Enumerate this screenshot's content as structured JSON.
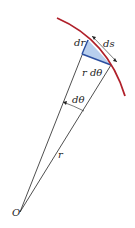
{
  "diagram": {
    "title": "",
    "labels": {
      "dr": "dr",
      "ds": "ds",
      "r_dtheta": "r dθ",
      "dtheta": "dθ",
      "r": "r",
      "origin": "O"
    },
    "colors": {
      "arc": "#b0202a",
      "triangle_fill": "#b8cfee",
      "triangle_edge": "#2b4fa0",
      "lines": "#222222"
    }
  }
}
